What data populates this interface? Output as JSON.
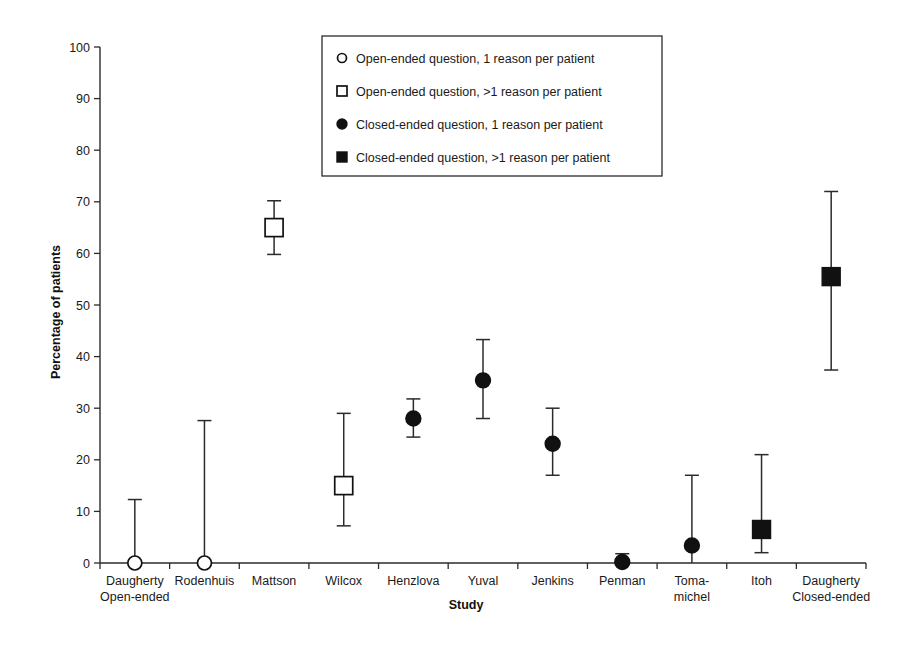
{
  "chart_data": {
    "type": "scatter",
    "title": "",
    "xlabel": "Study",
    "ylabel": "Percentage of patients",
    "ylim": [
      0,
      100
    ],
    "yticks": [
      0,
      10,
      20,
      30,
      40,
      50,
      60,
      70,
      80,
      90,
      100
    ],
    "grid": false,
    "legend_position": "top-center",
    "categories": [
      "Daugherty Open-ended",
      "Rodenhuis",
      "Mattson",
      "Wilcox",
      "Henzlova",
      "Yuval",
      "Jenkins",
      "Penman",
      "Toma-michel",
      "Itoh",
      "Daugherty Closed-ended"
    ],
    "category_labels": [
      [
        "Daugherty",
        "Open-ended"
      ],
      [
        "Rodenhuis",
        ""
      ],
      [
        "Mattson",
        ""
      ],
      [
        "Wilcox",
        ""
      ],
      [
        "Henzlova",
        ""
      ],
      [
        "Yuval",
        ""
      ],
      [
        "Jenkins",
        ""
      ],
      [
        "Penman",
        ""
      ],
      [
        "Toma-",
        "michel"
      ],
      [
        "Itoh",
        ""
      ],
      [
        "Daugherty",
        "Closed-ended"
      ]
    ],
    "legend": [
      {
        "label": "Open-ended question, 1 reason per patient",
        "marker": "open-circle"
      },
      {
        "label": "Open-ended question, >1 reason per patient",
        "marker": "open-square"
      },
      {
        "label": "Closed-ended question, 1 reason per patient",
        "marker": "filled-circle"
      },
      {
        "label": "Closed-ended question, >1 reason per patient",
        "marker": "filled-square"
      }
    ],
    "points": [
      {
        "category": "Daugherty Open-ended",
        "value": 0,
        "low": 0,
        "high": 12.3,
        "marker": "open-circle"
      },
      {
        "category": "Rodenhuis",
        "value": 0,
        "low": 0,
        "high": 27.6,
        "marker": "open-circle"
      },
      {
        "category": "Mattson",
        "value": 65.0,
        "low": 59.8,
        "high": 70.2,
        "marker": "open-square"
      },
      {
        "category": "Wilcox",
        "value": 15.0,
        "low": 7.2,
        "high": 29.0,
        "marker": "open-square"
      },
      {
        "category": "Henzlova",
        "value": 28.0,
        "low": 24.4,
        "high": 31.8,
        "marker": "filled-circle"
      },
      {
        "category": "Yuval",
        "value": 35.4,
        "low": 28.0,
        "high": 43.3,
        "marker": "filled-circle"
      },
      {
        "category": "Jenkins",
        "value": 23.1,
        "low": 17.0,
        "high": 30.0,
        "marker": "filled-circle"
      },
      {
        "category": "Penman",
        "value": 0.2,
        "low": 0,
        "high": 1.8,
        "marker": "filled-circle"
      },
      {
        "category": "Toma-michel",
        "value": 3.4,
        "low": 0,
        "high": 17.0,
        "marker": "filled-circle"
      },
      {
        "category": "Itoh",
        "value": 6.5,
        "low": 2.0,
        "high": 21.0,
        "marker": "filled-square"
      },
      {
        "category": "Daugherty Closed-ended",
        "value": 55.5,
        "low": 37.4,
        "high": 72.0,
        "marker": "filled-square"
      }
    ]
  },
  "colors": {
    "marker_fill": "#111111",
    "marker_stroke": "#111111",
    "axis": "#2b2b2b",
    "background": "#ffffff"
  }
}
